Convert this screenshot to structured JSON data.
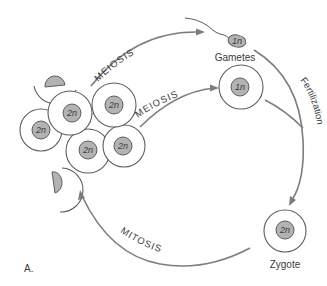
{
  "diagram": {
    "panel_label": "A.",
    "processes": {
      "meiosis_top": "MEIOSIS",
      "meiosis_middle": "MEIOSIS",
      "fertilization": "Fertilization",
      "mitosis": "MITOSIS"
    },
    "stages": {
      "gametes": "Gametes",
      "zygote": "Zygote"
    },
    "cells": {
      "diploid_label": "2n",
      "haploid_label": "1n",
      "cluster": [
        {
          "label": "2n"
        },
        {
          "label": "2n"
        },
        {
          "label": "2n"
        },
        {
          "label": "2n"
        },
        {
          "label": "2n"
        }
      ],
      "sperm": {
        "label": "1n"
      },
      "egg": {
        "label": "1n"
      },
      "zygote": {
        "label": "2n"
      }
    },
    "colors": {
      "outline": "#5c5c5c",
      "nucleus_fill": "#b3b3b3",
      "arrow": "#7d7d7d",
      "text": "#3a3a3a"
    }
  }
}
